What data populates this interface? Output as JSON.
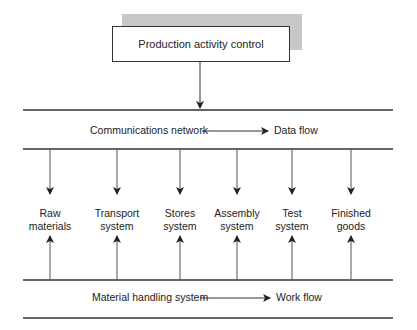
{
  "top_box": {
    "label": "Production activity control"
  },
  "communications": {
    "label": "Communications network",
    "flow_label": "Data flow"
  },
  "material_handling": {
    "label": "Material handling system",
    "flow_label": "Work flow"
  },
  "nodes": [
    {
      "line1": "Raw",
      "line2": "materials",
      "x": 50
    },
    {
      "line1": "Transport",
      "line2": "system",
      "x": 117
    },
    {
      "line1": "Stores",
      "line2": "system",
      "x": 180
    },
    {
      "line1": "Assembly",
      "line2": "system",
      "x": 237
    },
    {
      "line1": "Test",
      "line2": "system",
      "x": 292
    },
    {
      "line1": "Finished",
      "line2": "goods",
      "x": 351
    }
  ],
  "colors": {
    "line": "#333333",
    "shadow": "#c8c8c8"
  }
}
